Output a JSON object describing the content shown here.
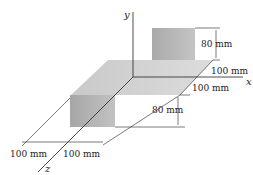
{
  "diagram": {
    "axes": {
      "x": "x",
      "y": "y",
      "z": "z"
    },
    "dimensions": {
      "upper_plate_height": "80 mm",
      "upper_offset": "100 mm",
      "plate_width_right": "100 mm",
      "lower_plate_height": "80 mm",
      "bottom_left": "100 mm",
      "bottom_right": "100 mm"
    },
    "colors": {
      "plate_top": "#cfcfcf",
      "plate_vertical": "#b8b8b8",
      "line": "#222222"
    }
  }
}
